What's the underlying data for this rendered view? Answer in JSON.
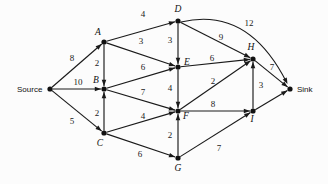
{
  "diagram": {
    "type": "directed-weighted-graph",
    "background_color": "#fcfcfc",
    "ink_color": "#1a1a1a",
    "width": 328,
    "height": 184,
    "nodes": [
      {
        "id": "Source",
        "label": "Source",
        "label_style": "plain",
        "x": 50,
        "y": 89,
        "label_x": 17,
        "label_y": 92,
        "anchor": "start"
      },
      {
        "id": "A",
        "label": "A",
        "label_style": "italic",
        "x": 104,
        "y": 42,
        "label_x": 98,
        "label_y": 35,
        "anchor": "middle"
      },
      {
        "id": "B",
        "label": "B",
        "label_style": "italic",
        "x": 104,
        "y": 89,
        "label_x": 96,
        "label_y": 83,
        "anchor": "middle"
      },
      {
        "id": "C",
        "label": "C",
        "label_style": "italic",
        "x": 104,
        "y": 133,
        "label_x": 100,
        "label_y": 146,
        "anchor": "middle"
      },
      {
        "id": "D",
        "label": "D",
        "label_style": "italic",
        "x": 178,
        "y": 21,
        "label_x": 178,
        "label_y": 12,
        "anchor": "middle"
      },
      {
        "id": "E",
        "label": "E",
        "label_style": "italic",
        "x": 178,
        "y": 67,
        "label_x": 187,
        "label_y": 65,
        "anchor": "middle"
      },
      {
        "id": "F",
        "label": "F",
        "label_style": "italic",
        "x": 178,
        "y": 111,
        "label_x": 186,
        "label_y": 119,
        "anchor": "middle"
      },
      {
        "id": "G",
        "label": "G",
        "label_style": "italic",
        "x": 178,
        "y": 158,
        "label_x": 178,
        "label_y": 171,
        "anchor": "middle"
      },
      {
        "id": "H",
        "label": "H",
        "label_style": "italic",
        "x": 253,
        "y": 59,
        "label_x": 251,
        "label_y": 50,
        "anchor": "middle"
      },
      {
        "id": "I",
        "label": "I",
        "label_style": "italic",
        "x": 253,
        "y": 111,
        "label_x": 252,
        "label_y": 122,
        "anchor": "middle"
      },
      {
        "id": "Sink",
        "label": "Sink",
        "label_style": "plain",
        "x": 290,
        "y": 89,
        "label_x": 297,
        "label_y": 92,
        "anchor": "start"
      }
    ],
    "edges": [
      {
        "from": "Source",
        "to": "A",
        "weight": 8,
        "label_x": 72,
        "label_y": 61,
        "shape": "line"
      },
      {
        "from": "Source",
        "to": "B",
        "weight": 10,
        "label_x": 78,
        "label_y": 85,
        "shape": "line"
      },
      {
        "from": "Source",
        "to": "C",
        "weight": 5,
        "label_x": 72,
        "label_y": 124,
        "shape": "line"
      },
      {
        "from": "A",
        "to": "B",
        "weight": 2,
        "label_x": 97,
        "label_y": 66,
        "shape": "line"
      },
      {
        "from": "A",
        "to": "D",
        "weight": 4,
        "label_x": 143,
        "label_y": 17,
        "shape": "line"
      },
      {
        "from": "A",
        "to": "E",
        "weight": 3,
        "label_x": 141,
        "label_y": 44,
        "shape": "line"
      },
      {
        "from": "B",
        "to": "E",
        "weight": 6,
        "label_x": 143,
        "label_y": 70,
        "shape": "line"
      },
      {
        "from": "B",
        "to": "F",
        "weight": 7,
        "label_x": 143,
        "label_y": 95,
        "shape": "line"
      },
      {
        "from": "C",
        "to": "B",
        "weight": 2,
        "label_x": 97,
        "label_y": 116,
        "shape": "line"
      },
      {
        "from": "C",
        "to": "F",
        "weight": 4,
        "label_x": 143,
        "label_y": 119,
        "shape": "line"
      },
      {
        "from": "C",
        "to": "G",
        "weight": 6,
        "label_x": 140,
        "label_y": 157,
        "shape": "line"
      },
      {
        "from": "D",
        "to": "E",
        "weight": 3,
        "label_x": 170,
        "label_y": 43,
        "shape": "line"
      },
      {
        "from": "D",
        "to": "H",
        "weight": 9,
        "label_x": 221,
        "label_y": 40,
        "shape": "line"
      },
      {
        "from": "D",
        "to": "Sink",
        "weight": 12,
        "label_x": 249,
        "label_y": 26,
        "shape": "arc"
      },
      {
        "from": "E",
        "to": "F",
        "weight": 4,
        "label_x": 170,
        "label_y": 91,
        "shape": "line"
      },
      {
        "from": "E",
        "to": "H",
        "weight": 6,
        "label_x": 212,
        "label_y": 61,
        "shape": "line"
      },
      {
        "from": "F",
        "to": "H",
        "weight": 2,
        "label_x": 213,
        "label_y": 84,
        "shape": "line"
      },
      {
        "from": "F",
        "to": "I",
        "weight": 8,
        "label_x": 213,
        "label_y": 107,
        "shape": "line"
      },
      {
        "from": "G",
        "to": "F",
        "weight": 2,
        "label_x": 170,
        "label_y": 138,
        "shape": "line"
      },
      {
        "from": "G",
        "to": "I",
        "weight": 7,
        "label_x": 219,
        "label_y": 151,
        "shape": "line"
      },
      {
        "from": "H",
        "to": "Sink",
        "weight": 7,
        "label_x": 272,
        "label_y": 70,
        "shape": "line"
      },
      {
        "from": "I",
        "to": "H",
        "weight": 3,
        "label_x": 261,
        "label_y": 88,
        "shape": "line"
      },
      {
        "from": "I",
        "to": "Sink",
        "weight": null,
        "label_x": null,
        "label_y": null,
        "shape": "line"
      }
    ]
  }
}
